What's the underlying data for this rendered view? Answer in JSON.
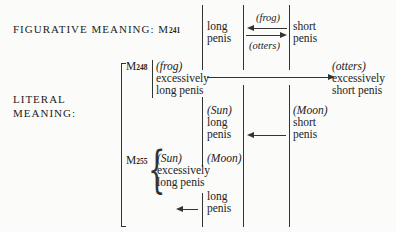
{
  "labels": {
    "figurative": "FIGURATIVE MEANING:",
    "literal_1": "LITERAL",
    "literal_2": "MEANING:"
  },
  "myths": {
    "m241": {
      "prefix": "M",
      "num": "241"
    },
    "m248": {
      "prefix": "M",
      "num": "248"
    },
    "m255": {
      "prefix": "M",
      "num": "255"
    }
  },
  "figurative_row": {
    "left": {
      "line1": "long",
      "line2": "penis"
    },
    "arrow_top_label": "(frog)",
    "arrow_bottom_label": "(otters)",
    "right": {
      "line1": "short",
      "line2": "penis"
    }
  },
  "m248_row": {
    "left": {
      "agent": "(frog)",
      "line1": "excessively",
      "line2": "long penis"
    },
    "right": {
      "agent": "(otters)",
      "line1": "excessively",
      "line2": "short penis"
    }
  },
  "sun_moon_row": {
    "left": {
      "agent": "(Sun)",
      "line1": "long",
      "line2": "penis"
    },
    "right": {
      "agent": "(Moon)",
      "line1": "short",
      "line2": "penis"
    }
  },
  "m255_row": {
    "sun": {
      "agent": "(Sun)",
      "line1": "excessively",
      "line2": "long penis"
    },
    "moon": {
      "agent": "(Moon)"
    },
    "target": {
      "line1": "long",
      "line2": "penis"
    }
  }
}
